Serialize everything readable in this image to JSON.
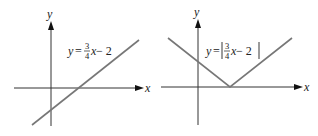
{
  "figure": {
    "panels": [
      {
        "id": "left",
        "axis_labels": {
          "x": "x",
          "y": "y"
        },
        "equation": {
          "lhs": "y",
          "eq": "=",
          "num": "3",
          "den": "4",
          "var": "x",
          "rest": " − 2",
          "bars": false
        },
        "graph": "line"
      },
      {
        "id": "right",
        "axis_labels": {
          "x": "x",
          "y": "y"
        },
        "equation": {
          "lhs": "y",
          "eq": "=",
          "num": "3",
          "den": "4",
          "var": "x",
          "rest": " − 2",
          "bars": true
        },
        "graph": "absolute-value V"
      }
    ],
    "colors": {
      "axis": "#333333",
      "curve": "#777777",
      "text": "#222222"
    }
  }
}
